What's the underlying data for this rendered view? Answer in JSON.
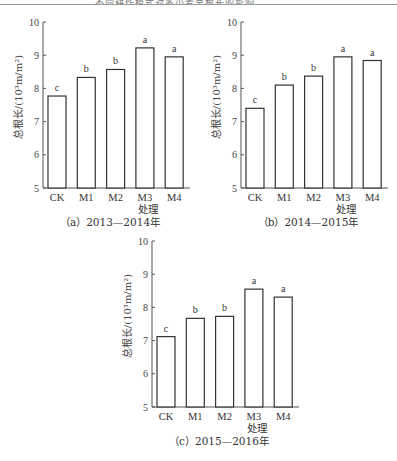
{
  "header": {
    "running_title": "不同耕作模式对冬小麦总根长的影响"
  },
  "chart_data": [
    {
      "type": "bar",
      "panel": "a",
      "title": "（a）2013—2014年",
      "xlabel": "处理",
      "ylabel": "总根长/(10³m/m²)",
      "ylim": [
        5,
        10
      ],
      "yticks": [
        5,
        6,
        7,
        8,
        9,
        10
      ],
      "grid": false,
      "categories": [
        "CK",
        "M1",
        "M2",
        "M3",
        "M4"
      ],
      "values": [
        7.77,
        8.33,
        8.57,
        9.22,
        8.95
      ],
      "significance": [
        "c",
        "b",
        "b",
        "a",
        "a"
      ]
    },
    {
      "type": "bar",
      "panel": "b",
      "title": "（b）2014—2015年",
      "xlabel": "处理",
      "ylabel": "总根长/(10³m/m²)",
      "ylim": [
        5,
        10
      ],
      "yticks": [
        5,
        6,
        7,
        8,
        9,
        10
      ],
      "grid": false,
      "categories": [
        "CK",
        "M1",
        "M2",
        "M3",
        "M4"
      ],
      "values": [
        7.4,
        8.1,
        8.37,
        8.95,
        8.84
      ],
      "significance": [
        "c",
        "b",
        "b",
        "a",
        "a"
      ]
    },
    {
      "type": "bar",
      "panel": "c",
      "title": "（c）2015—2016年",
      "xlabel": "处理",
      "ylabel": "总根长/(10³m/m²)",
      "ylim": [
        5,
        10
      ],
      "yticks": [
        5,
        6,
        7,
        8,
        9,
        10
      ],
      "grid": false,
      "categories": [
        "CK",
        "M1",
        "M2",
        "M3",
        "M4"
      ],
      "values": [
        7.12,
        7.67,
        7.73,
        8.55,
        8.31
      ],
      "significance": [
        "c",
        "b",
        "b",
        "a",
        "a"
      ]
    }
  ],
  "colors": {
    "bar_fill": "#ffffff",
    "bar_stroke": "#333333",
    "axis": "#555555",
    "text": "#333333"
  }
}
